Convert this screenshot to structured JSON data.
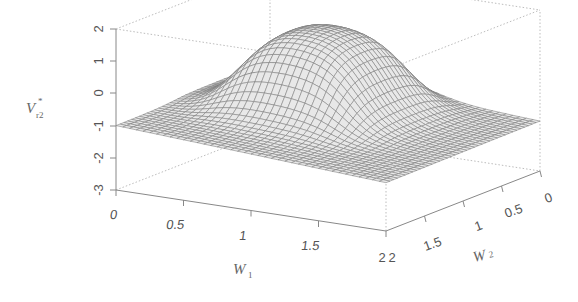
{
  "chart_data": {
    "type": "surface3d",
    "title": "",
    "xlabel": "W1",
    "ylabel": "W2",
    "zlabel": "V*r2",
    "x_ticks": [
      "0",
      "0.5",
      "1",
      "1.5",
      "2"
    ],
    "y_ticks": [
      "2",
      "1.5",
      "1",
      "0.5",
      "0"
    ],
    "z_ticks": [
      "-3",
      "-2",
      "-1",
      "0",
      "1",
      "2"
    ],
    "x_range": [
      0,
      2
    ],
    "y_range": [
      0,
      2
    ],
    "z_range": [
      -3,
      2
    ],
    "grid": false,
    "legend": null,
    "surface_description": "Wireframe surface with a raised plateau near W1≈0.5–1.2, W2≈0.3–1.2 reaching z≈1.5, sloping down to about -1 at W1=0 and about -1.4 to -1.5 at W1=2",
    "sample_points": [
      {
        "W1": 0,
        "W2": 2,
        "z": -1.0
      },
      {
        "W1": 0,
        "W2": 0,
        "z": -0.9
      },
      {
        "W1": 2,
        "W2": 2,
        "z": -1.5
      },
      {
        "W1": 2,
        "W2": 0,
        "z": -1.4
      },
      {
        "W1": 0.8,
        "W2": 0.8,
        "z": 1.5
      },
      {
        "W1": 1.0,
        "W2": 1.0,
        "z": 0.9
      }
    ]
  },
  "labels": {
    "z_axis_title": "V",
    "z_axis_sub": "r2",
    "z_axis_sup": "*",
    "x_axis_title": "W",
    "x_axis_sub": "1",
    "y_axis_title": "W",
    "y_axis_sub": "2",
    "x_tick_0": "0",
    "x_tick_1": "0.5",
    "x_tick_2": "1",
    "x_tick_3": "1.5",
    "x_tick_4": "2",
    "y_tick_0": "2",
    "y_tick_1": "1.5",
    "y_tick_2": "1",
    "y_tick_3": "0.5",
    "y_tick_4": "0",
    "z_tick_0": "2",
    "z_tick_1": "1",
    "z_tick_2": "0",
    "z_tick_3": "-1",
    "z_tick_4": "-2",
    "z_tick_5": "-3"
  }
}
